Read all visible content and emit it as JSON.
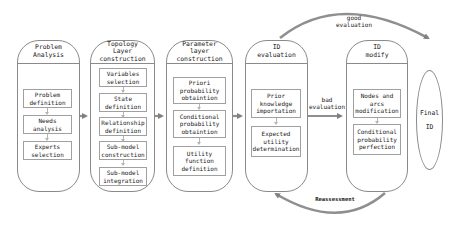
{
  "diagram": {
    "type": "process-flow",
    "columns": [
      {
        "id": "problem-analysis",
        "title": "Problem\nAnalysis",
        "steps": [
          "Problem\ndefinition",
          "Needs\nanalysis",
          "Experts\nselection"
        ]
      },
      {
        "id": "topology",
        "title": "Topology\nLayer construction",
        "steps": [
          "Variables\nselection",
          "State\ndefinition",
          "Relationship\ndefinition",
          "Sub-model\nconstruction",
          "Sub-model\nintegration"
        ]
      },
      {
        "id": "parameter",
        "title": "Parameter\nlayer construction",
        "steps": [
          "Priori\nprobability\nobtaintion",
          "Conditional\nprobability\nobtaintion",
          "Utility\nfunction\ndefinition"
        ]
      },
      {
        "id": "id-evaluation",
        "title": "ID\nevaluation",
        "steps": [
          "Prior\nknowledge\nimportation",
          "Expected\nutility\ndetermination"
        ]
      },
      {
        "id": "id-modify",
        "title": "ID\nmodify",
        "steps": [
          "Nodes and\narcs\nmodification",
          "Conditional\nprobability\nperfection"
        ]
      }
    ],
    "final": {
      "line1": "Final",
      "line2": "ID"
    },
    "edges": {
      "good": "good\nevaluation",
      "bad": "bad\nevaluation",
      "reassessment": "Reassessment"
    },
    "colors": {
      "border": "#8a8a8a",
      "arrow": "#808080",
      "step_border": "#a0a0a0"
    }
  }
}
